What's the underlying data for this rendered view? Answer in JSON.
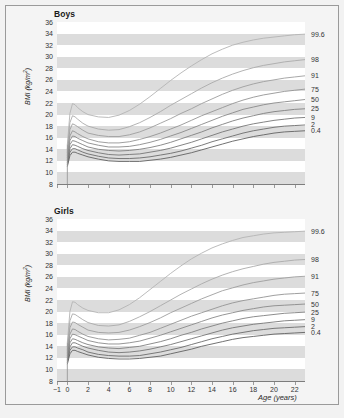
{
  "figure": {
    "background_color": "#f2f2f2",
    "panel_background": "#ffffff",
    "band_color": "#dcdcdc",
    "frame_color": "#9a9a9a"
  },
  "axis": {
    "ylabel": "BMI (kg/m",
    "ylabel_sup": "2",
    "ylabel_close": ")",
    "xlabel": "Age (years)",
    "yticks": [
      "36",
      "34",
      "32",
      "30",
      "28",
      "26",
      "24",
      "22",
      "20",
      "18",
      "16",
      "14",
      "12",
      "10",
      "8"
    ],
    "xticks": [
      "−1",
      "0",
      "2",
      "4",
      "6",
      "8",
      "10",
      "12",
      "14",
      "16",
      "18",
      "20",
      "22"
    ]
  },
  "panels": [
    {
      "title": "Boys"
    },
    {
      "title": "Girls"
    }
  ],
  "percentile_labels": [
    "99.6",
    "98",
    "91",
    "75",
    "50",
    "25",
    "9",
    "2",
    "0.4"
  ],
  "chart_data": {
    "type": "line",
    "xlabel": "Age (years)",
    "ylabel": "BMI (kg/m2)",
    "xlim": [
      -1,
      23
    ],
    "ylim": [
      8,
      36
    ],
    "grid": "horizontal alternating grey bands every 2 BMI units",
    "legend_position": "right-edge end-of-curve labels",
    "x": [
      0,
      0.25,
      0.5,
      0.75,
      1,
      1.5,
      2,
      3,
      4,
      5,
      6,
      7,
      8,
      9,
      10,
      11,
      12,
      13,
      14,
      15,
      16,
      17,
      18,
      19,
      20,
      21,
      22,
      23
    ],
    "panels": [
      {
        "name": "Boys",
        "series": [
          {
            "name": "99.6",
            "color": "#b4b4b4",
            "values": [
              14.8,
              20.2,
              21.9,
              21.7,
              21.2,
              20.5,
              20.0,
              19.6,
              19.5,
              19.9,
              20.7,
              21.8,
              23.1,
              24.5,
              25.9,
              27.2,
              28.4,
              29.5,
              30.5,
              31.3,
              32.0,
              32.5,
              32.9,
              33.2,
              33.4,
              33.6,
              33.8,
              33.9
            ]
          },
          {
            "name": "98",
            "color": "#aaaaaa",
            "values": [
              14.0,
              18.6,
              19.8,
              19.6,
              19.2,
              18.5,
              18.0,
              17.5,
              17.3,
              17.4,
              17.9,
              18.6,
              19.5,
              20.5,
              21.6,
              22.6,
              23.6,
              24.6,
              25.5,
              26.3,
              27.0,
              27.6,
              28.1,
              28.5,
              28.8,
              29.1,
              29.3,
              29.5
            ]
          },
          {
            "name": "91",
            "color": "#9e9e9e",
            "values": [
              13.4,
              17.4,
              18.4,
              18.2,
              17.9,
              17.3,
              16.8,
              16.4,
              16.2,
              16.2,
              16.5,
              17.0,
              17.7,
              18.5,
              19.3,
              20.2,
              21.0,
              21.9,
              22.7,
              23.5,
              24.2,
              24.8,
              25.3,
              25.7,
              26.0,
              26.3,
              26.5,
              26.7
            ]
          },
          {
            "name": "75",
            "color": "#949494",
            "values": [
              12.9,
              16.3,
              17.2,
              17.0,
              16.7,
              16.2,
              15.8,
              15.3,
              15.1,
              15.1,
              15.3,
              15.7,
              16.2,
              16.8,
              17.5,
              18.2,
              19.0,
              19.8,
              20.5,
              21.2,
              21.9,
              22.5,
              23.0,
              23.4,
              23.7,
              24.0,
              24.2,
              24.4
            ]
          },
          {
            "name": "50",
            "color": "#8a8a8a",
            "values": [
              12.5,
              15.5,
              16.3,
              16.2,
              15.9,
              15.5,
              15.1,
              14.7,
              14.4,
              14.4,
              14.5,
              14.8,
              15.2,
              15.7,
              16.3,
              16.9,
              17.6,
              18.3,
              19.0,
              19.7,
              20.3,
              20.9,
              21.3,
              21.7,
              22.0,
              22.2,
              22.4,
              22.6
            ]
          },
          {
            "name": "25",
            "color": "#808080",
            "values": [
              12.1,
              14.8,
              15.5,
              15.4,
              15.2,
              14.8,
              14.4,
              14.0,
              13.8,
              13.7,
              13.8,
              14.0,
              14.3,
              14.7,
              15.2,
              15.8,
              16.4,
              17.0,
              17.7,
              18.3,
              18.9,
              19.4,
              19.8,
              20.2,
              20.5,
              20.7,
              20.9,
              21.0
            ]
          },
          {
            "name": "9",
            "color": "#767676",
            "values": [
              11.7,
              14.1,
              14.8,
              14.7,
              14.5,
              14.1,
              13.8,
              13.4,
              13.1,
              13.0,
              13.1,
              13.2,
              13.5,
              13.8,
              14.2,
              14.7,
              15.2,
              15.8,
              16.4,
              17.0,
              17.5,
              18.0,
              18.4,
              18.7,
              19.0,
              19.2,
              19.4,
              19.5
            ]
          },
          {
            "name": "2",
            "color": "#6c6c6c",
            "values": [
              11.3,
              13.5,
              14.1,
              14.1,
              13.9,
              13.5,
              13.2,
              12.8,
              12.5,
              12.4,
              12.4,
              12.5,
              12.7,
              13.0,
              13.3,
              13.7,
              14.2,
              14.7,
              15.3,
              15.8,
              16.3,
              16.8,
              17.2,
              17.5,
              17.8,
              18.0,
              18.1,
              18.2
            ]
          },
          {
            "name": "0.4",
            "color": "#626262",
            "values": [
              11.0,
              12.9,
              13.5,
              13.5,
              13.3,
              13.0,
              12.7,
              12.3,
              12.0,
              11.9,
              11.9,
              11.9,
              12.1,
              12.3,
              12.6,
              13.0,
              13.4,
              13.9,
              14.4,
              14.9,
              15.4,
              15.8,
              16.2,
              16.5,
              16.8,
              17.0,
              17.1,
              17.2
            ]
          }
        ]
      },
      {
        "name": "Girls",
        "series": [
          {
            "name": "99.6",
            "color": "#b4b4b4",
            "values": [
              14.6,
              20.0,
              21.7,
              21.6,
              21.2,
              20.6,
              20.2,
              19.8,
              19.8,
              20.3,
              21.2,
              22.4,
              23.8,
              25.2,
              26.6,
              27.9,
              29.1,
              30.1,
              31.0,
              31.7,
              32.3,
              32.8,
              33.1,
              33.4,
              33.6,
              33.7,
              33.8,
              33.9
            ]
          },
          {
            "name": "98",
            "color": "#aaaaaa",
            "values": [
              13.9,
              18.4,
              19.6,
              19.5,
              19.2,
              18.6,
              18.1,
              17.6,
              17.5,
              17.7,
              18.3,
              19.1,
              20.0,
              21.0,
              22.0,
              23.0,
              23.9,
              24.8,
              25.6,
              26.3,
              26.9,
              27.4,
              27.8,
              28.2,
              28.5,
              28.7,
              28.9,
              29.0
            ]
          },
          {
            "name": "91",
            "color": "#9e9e9e",
            "values": [
              13.3,
              17.2,
              18.2,
              18.1,
              17.8,
              17.3,
              16.8,
              16.4,
              16.3,
              16.4,
              16.8,
              17.4,
              18.1,
              18.9,
              19.8,
              20.6,
              21.4,
              22.2,
              22.9,
              23.6,
              24.1,
              24.6,
              25.0,
              25.3,
              25.6,
              25.8,
              26.0,
              26.1
            ]
          },
          {
            "name": "75",
            "color": "#949494",
            "values": [
              12.8,
              16.1,
              17.0,
              16.9,
              16.6,
              16.1,
              15.7,
              15.3,
              15.1,
              15.2,
              15.4,
              15.9,
              16.4,
              17.1,
              17.8,
              18.5,
              19.2,
              19.8,
              20.4,
              21.0,
              21.5,
              21.9,
              22.2,
              22.5,
              22.8,
              23.0,
              23.1,
              23.2
            ]
          },
          {
            "name": "50",
            "color": "#8a8a8a",
            "values": [
              12.4,
              15.3,
              16.1,
              16.0,
              15.8,
              15.4,
              15.0,
              14.6,
              14.4,
              14.4,
              14.6,
              14.9,
              15.4,
              15.9,
              16.5,
              17.1,
              17.7,
              18.3,
              18.9,
              19.4,
              19.8,
              20.2,
              20.5,
              20.8,
              21.0,
              21.1,
              21.2,
              21.3
            ]
          },
          {
            "name": "25",
            "color": "#808080",
            "values": [
              12.0,
              14.6,
              15.3,
              15.2,
              15.0,
              14.6,
              14.3,
              13.9,
              13.7,
              13.6,
              13.8,
              14.0,
              14.4,
              14.8,
              15.3,
              15.9,
              16.4,
              17.0,
              17.5,
              18.0,
              18.4,
              18.8,
              19.1,
              19.3,
              19.5,
              19.7,
              19.8,
              19.9
            ]
          },
          {
            "name": "9",
            "color": "#767676",
            "values": [
              11.6,
              13.9,
              14.6,
              14.6,
              14.4,
              14.0,
              13.7,
              13.3,
              13.0,
              12.9,
              13.0,
              13.2,
              13.5,
              13.9,
              14.3,
              14.8,
              15.3,
              15.8,
              16.3,
              16.8,
              17.2,
              17.5,
              17.8,
              18.0,
              18.2,
              18.4,
              18.5,
              18.6
            ]
          },
          {
            "name": "2",
            "color": "#6c6c6c",
            "values": [
              11.2,
              13.3,
              13.9,
              13.9,
              13.7,
              13.4,
              13.0,
              12.6,
              12.4,
              12.3,
              12.3,
              12.4,
              12.7,
              13.0,
              13.4,
              13.8,
              14.3,
              14.8,
              15.3,
              15.7,
              16.1,
              16.4,
              16.7,
              16.9,
              17.1,
              17.2,
              17.3,
              17.4
            ]
          },
          {
            "name": "0.4",
            "color": "#626262",
            "values": [
              10.9,
              12.7,
              13.3,
              13.3,
              13.1,
              12.8,
              12.5,
              12.1,
              11.9,
              11.8,
              11.8,
              11.9,
              12.1,
              12.3,
              12.7,
              13.1,
              13.5,
              14.0,
              14.4,
              14.8,
              15.2,
              15.5,
              15.7,
              15.9,
              16.1,
              16.2,
              16.3,
              16.4
            ]
          }
        ]
      }
    ]
  }
}
